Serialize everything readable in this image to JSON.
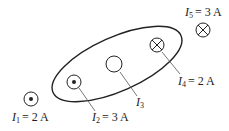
{
  "diagram": {
    "stroke_color": "#222222",
    "currents": [
      {
        "id": "I1",
        "symbol": "I",
        "subscript": "1",
        "value": "= 2 A",
        "direction": "out-of-page (dot)",
        "inside_loop": false
      },
      {
        "id": "I2",
        "symbol": "I",
        "subscript": "2",
        "value": "= 3 A",
        "direction": "out-of-page (dot)",
        "inside_loop": true
      },
      {
        "id": "I3",
        "symbol": "I",
        "subscript": "3",
        "value": "",
        "direction": "unknown (empty circle)",
        "inside_loop": true
      },
      {
        "id": "I4",
        "symbol": "I",
        "subscript": "4",
        "value": "= 2 A",
        "direction": "into-page (cross)",
        "inside_loop": true
      },
      {
        "id": "I5",
        "symbol": "I",
        "subscript": "5",
        "value": "= 3 A",
        "direction": "into-page (cross)",
        "inside_loop": false
      }
    ]
  }
}
